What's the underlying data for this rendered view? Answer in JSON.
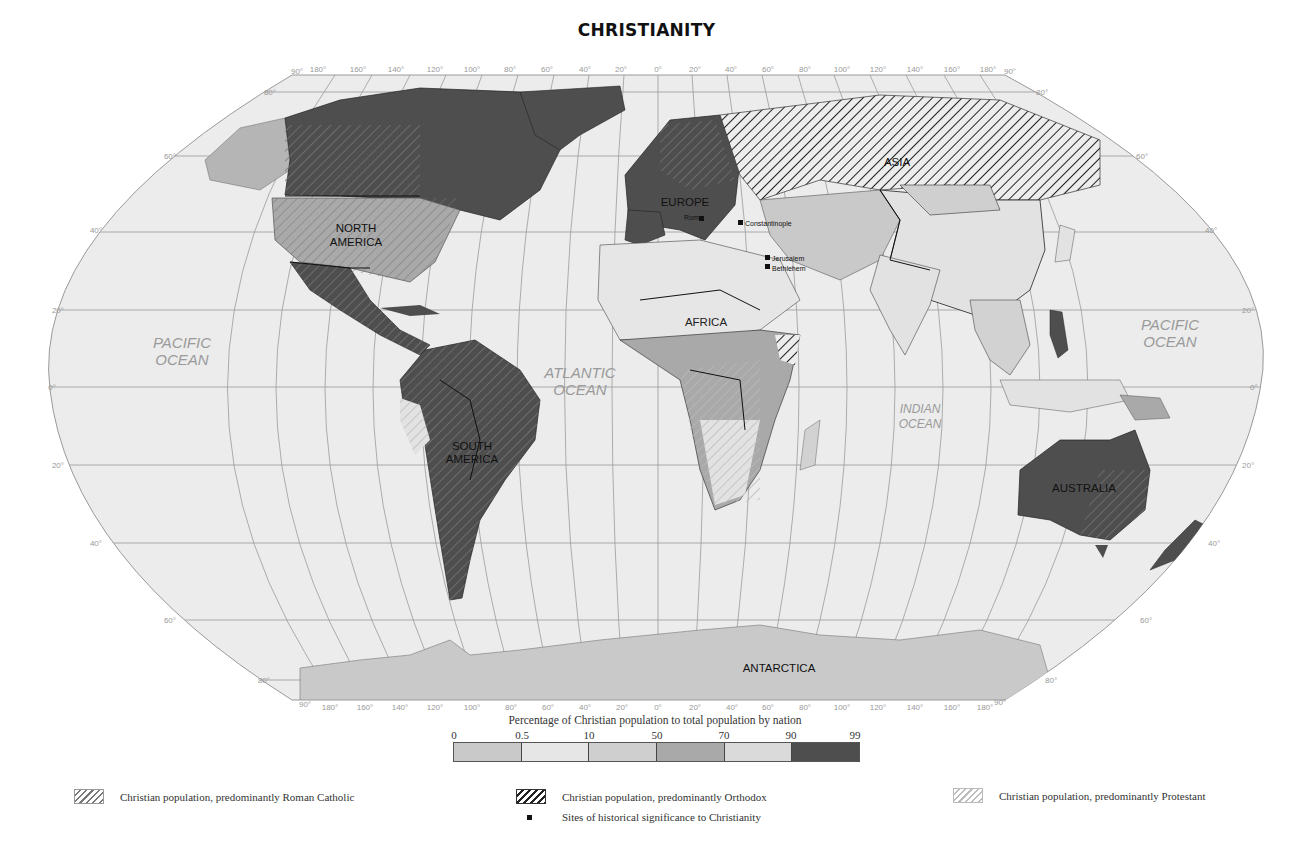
{
  "title": "CHRISTIANITY",
  "oceans": [
    {
      "label_line1": "PACIFIC",
      "label_line2": "OCEAN",
      "x": 182,
      "y": 348
    },
    {
      "label_line1": "ATLANTIC",
      "label_line2": "OCEAN",
      "x": 580,
      "y": 378
    },
    {
      "label_line1": "INDIAN",
      "label_line2": "OCEAN",
      "x": 920,
      "y": 413
    },
    {
      "label_line1": "PACIFIC",
      "label_line2": "OCEAN",
      "x": 1170,
      "y": 330
    }
  ],
  "continents": [
    {
      "label_line1": "NORTH",
      "label_line2": "AMERICA",
      "x": 356,
      "y": 232
    },
    {
      "label_line1": "SOUTH",
      "label_line2": "AMERICA",
      "x": 472,
      "y": 450
    },
    {
      "label_line1": "EUROPE",
      "label_line2": "",
      "x": 685,
      "y": 206
    },
    {
      "label_line1": "ASIA",
      "label_line2": "",
      "x": 897,
      "y": 166
    },
    {
      "label_line1": "AFRICA",
      "label_line2": "",
      "x": 706,
      "y": 326
    },
    {
      "label_line1": "AUSTRALIA",
      "label_line2": "",
      "x": 1084,
      "y": 492
    },
    {
      "label_line1": "ANTARCTICA",
      "label_line2": "",
      "x": 779,
      "y": 672
    }
  ],
  "sites": [
    {
      "name": "Rome",
      "x": 703,
      "y": 220
    },
    {
      "name": "Constantinople",
      "x": 742,
      "y": 224
    },
    {
      "name": "Jerusalem",
      "x": 768,
      "y": 259
    },
    {
      "name": "Bethlehem",
      "x": 768,
      "y": 268
    }
  ],
  "graticule": {
    "top_longitudes": [
      "180°",
      "160°",
      "140°",
      "120°",
      "100°",
      "80°",
      "60°",
      "40°",
      "20°",
      "0°",
      "20°",
      "40°",
      "60°",
      "80°",
      "100°",
      "120°",
      "140°",
      "160°",
      "180°"
    ],
    "bottom_longitudes": [
      "180°",
      "160°",
      "140°",
      "120°",
      "100°",
      "80°",
      "60°",
      "40°",
      "20°",
      "0°",
      "20°",
      "40°",
      "60°",
      "80°",
      "100°",
      "120°",
      "140°",
      "160°",
      "180°"
    ],
    "pole_label": "90°",
    "latitudes_left": [
      "80°",
      "60°",
      "40°",
      "20°",
      "0°",
      "20°",
      "40°",
      "60°",
      "80°"
    ],
    "latitudes_right": [
      "80°",
      "60°",
      "40°",
      "20°",
      "0°",
      "20°",
      "40°",
      "60°",
      "80°"
    ]
  },
  "scale": {
    "title": "Percentage of Christian population to total population by nation",
    "ticks": [
      "0",
      "0.5",
      "10",
      "50",
      "70",
      "90",
      "99"
    ],
    "swatches": [
      {
        "range": "0–0.5",
        "color": "#c9c9c9"
      },
      {
        "range": "0.5–10",
        "color": "#e6e6e6"
      },
      {
        "range": "10–50",
        "color": "#cfcfcf"
      },
      {
        "range": "50–70",
        "color": "#a9a9a9"
      },
      {
        "range": "70–90",
        "color": "#dadada"
      },
      {
        "range": "90–99",
        "color": "#4e4e4e"
      }
    ]
  },
  "legend": {
    "roman_catholic": "Christian population, predominantly Roman Catholic",
    "orthodox": "Christian population, predominantly Orthodox",
    "protestant": "Christian population, predominantly Protestant",
    "sites": "Sites of historical significance to Christianity"
  },
  "colors": {
    "ocean": "#ececec",
    "graticule": "#9a9a9a",
    "dark": "#4e4e4e",
    "mid": "#a9a9a9",
    "light": "#e2e2e2",
    "low": "#c9c9c9"
  }
}
